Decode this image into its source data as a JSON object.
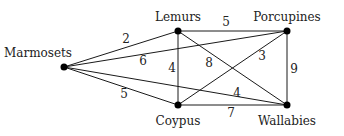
{
  "diagram": {
    "type": "weighted-graph",
    "nodes": [
      {
        "id": "marmosets",
        "label": "Marmosets",
        "x": 64,
        "y": 67,
        "lx": 38,
        "ly": 57
      },
      {
        "id": "lemurs",
        "label": "Lemurs",
        "x": 178,
        "y": 31,
        "lx": 178,
        "ly": 21
      },
      {
        "id": "porcupines",
        "label": "Porcupines",
        "x": 287,
        "y": 31,
        "lx": 287,
        "ly": 21
      },
      {
        "id": "coypus",
        "label": "Coypus",
        "x": 178,
        "y": 105,
        "lx": 178,
        "ly": 125
      },
      {
        "id": "wallabies",
        "label": "Wallabies",
        "x": 287,
        "y": 105,
        "lx": 287,
        "ly": 125
      }
    ],
    "edges": [
      {
        "from": "marmosets",
        "to": "lemurs",
        "weight": "2",
        "wx": 126,
        "wy": 43
      },
      {
        "from": "marmosets",
        "to": "porcupines",
        "weight": "6",
        "wx": 143,
        "wy": 65
      },
      {
        "from": "marmosets",
        "to": "coypus",
        "weight": "5",
        "wx": 124,
        "wy": 98
      },
      {
        "from": "marmosets",
        "to": "wallabies",
        "weight": "4",
        "wx": 237,
        "wy": 97
      },
      {
        "from": "lemurs",
        "to": "porcupines",
        "weight": "5",
        "wx": 226,
        "wy": 26
      },
      {
        "from": "lemurs",
        "to": "coypus",
        "weight": "4",
        "wx": 172,
        "wy": 72
      },
      {
        "from": "lemurs",
        "to": "wallabies",
        "weight": "8",
        "wx": 209,
        "wy": 67
      },
      {
        "from": "porcupines",
        "to": "coypus",
        "weight": "3",
        "wx": 262,
        "wy": 60
      },
      {
        "from": "porcupines",
        "to": "wallabies",
        "weight": "9",
        "wx": 294,
        "wy": 73
      },
      {
        "from": "coypus",
        "to": "wallabies",
        "weight": "7",
        "wx": 231,
        "wy": 117
      }
    ]
  }
}
